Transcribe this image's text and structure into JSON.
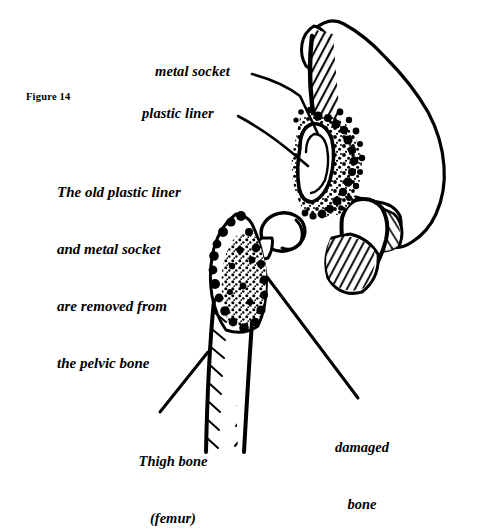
{
  "figure": {
    "number_label": "Figure 14",
    "title_caption": "The old plastic liner\nand metal socket\nare removed from\nthe pelvic bone",
    "caption_lines": [
      "The old plastic liner",
      "and metal socket",
      "are removed from",
      "the pelvic bone"
    ],
    "ink_color": "#000000",
    "background_color": "#ffffff"
  },
  "callouts": {
    "metal_socket": "metal socket",
    "plastic_liner": "plastic liner",
    "damaged_bone_lines": [
      "damaged",
      "bone"
    ],
    "thigh_bone_lines": [
      "Thigh bone",
      "(femur)"
    ]
  },
  "anatomy": {
    "pelvis": "pelvic-bone",
    "acetabulum": "acetabulum-socket-cavity",
    "obturator_foramen": "obturator-foramen",
    "iliac_crest": "iliac-crest",
    "ischial_tuberosity": "ischial-tuberosity",
    "femur": "femur-thigh-bone",
    "femoral_head": "femoral-head",
    "femoral_neck": "femoral-neck",
    "greater_trochanter": "greater-trochanter-damaged",
    "femoral_shaft": "femoral-shaft"
  }
}
